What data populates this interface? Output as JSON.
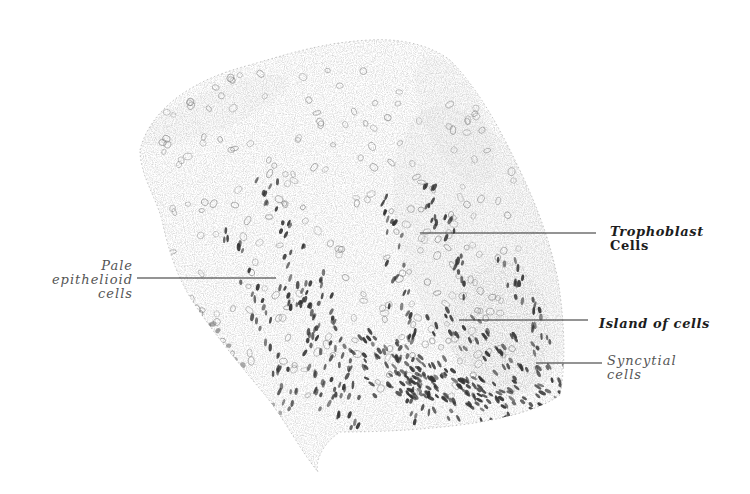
{
  "figure": {
    "type": "histology-illustration",
    "colors": {
      "background": "#ffffff",
      "ink": "#2a2a2a",
      "stipple": "#8a8a8a",
      "nuclei": "#3a3a3a"
    }
  },
  "labels": [
    {
      "id": "pale-epithelioid-cells",
      "lines": [
        "Pale",
        "epithelioid",
        "cells"
      ],
      "style": "italic-light",
      "align": "right",
      "leader": {
        "x1": 137,
        "y1": 278,
        "x2": 276,
        "y2": 278
      }
    },
    {
      "id": "trophoblast-cells",
      "lines": [
        "Trophoblast",
        "Cells"
      ],
      "style": "bold-italic",
      "align": "left",
      "leader": {
        "x1": 420,
        "y1": 233,
        "x2": 596,
        "y2": 233
      }
    },
    {
      "id": "island-of-cells",
      "lines": [
        "Island of cells"
      ],
      "style": "bold-italic",
      "align": "left",
      "leader": {
        "x1": 459,
        "y1": 320,
        "x2": 588,
        "y2": 320
      }
    },
    {
      "id": "syncytial-cells",
      "lines": [
        "Syncytial",
        "cells"
      ],
      "style": "italic-light",
      "align": "left",
      "leader": {
        "x1": 536,
        "y1": 363,
        "x2": 602,
        "y2": 363
      }
    }
  ]
}
